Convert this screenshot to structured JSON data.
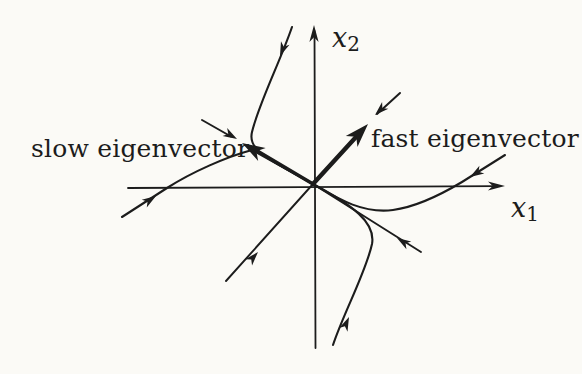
{
  "colors": {
    "background": "#fbfaf6",
    "ink": "#1c1c1c"
  },
  "labels": {
    "slow_eigenvector": "slow eigenvector",
    "fast_eigenvector": "fast eigenvector",
    "axis_horizontal": {
      "base": "x",
      "sub": "1"
    },
    "axis_vertical": {
      "base": "x",
      "sub": "2"
    }
  }
}
